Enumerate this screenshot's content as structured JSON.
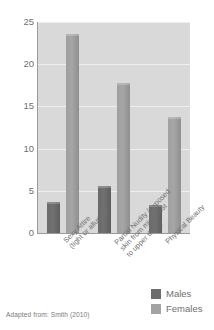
{
  "chart_data": {
    "type": "bar",
    "title": "",
    "subtitle": "",
    "xlabel": "",
    "ylabel": "",
    "ylim": [
      0,
      25
    ],
    "yticks": [
      0,
      5,
      10,
      15,
      20,
      25
    ],
    "ytick_labels": [
      "0",
      "5",
      "10",
      "15",
      "20",
      "25"
    ],
    "grid": true,
    "legend_position": "bottom-right",
    "categories": [
      "Sexy Attire (tight or alluring)",
      "Partial Nudity (exposed skin from mid chest to upper thigh)",
      "Physical Beauty"
    ],
    "category_lines": [
      [
        "Sexy Attire",
        "(tight or alluring)"
      ],
      [
        "Partial Nudity (exposed",
        "skin from mid chest",
        "to upper thigh)"
      ],
      [
        "Physical Beauty"
      ]
    ],
    "series": [
      {
        "name": "Males",
        "color": "#6d6d6d",
        "values": [
          3.7,
          5.6,
          3.3
        ]
      },
      {
        "name": "Females",
        "color": "#a3a3a3",
        "values": [
          23.6,
          17.8,
          13.7
        ]
      }
    ],
    "annotations": {
      "source": "Adapted from: Smith (2010)"
    }
  },
  "legend": {
    "items": [
      {
        "label": "Males",
        "swatch": "males-swatch"
      },
      {
        "label": "Females",
        "swatch": "females-swatch"
      }
    ]
  },
  "source_note": "Adapted from: Smith (2010)"
}
